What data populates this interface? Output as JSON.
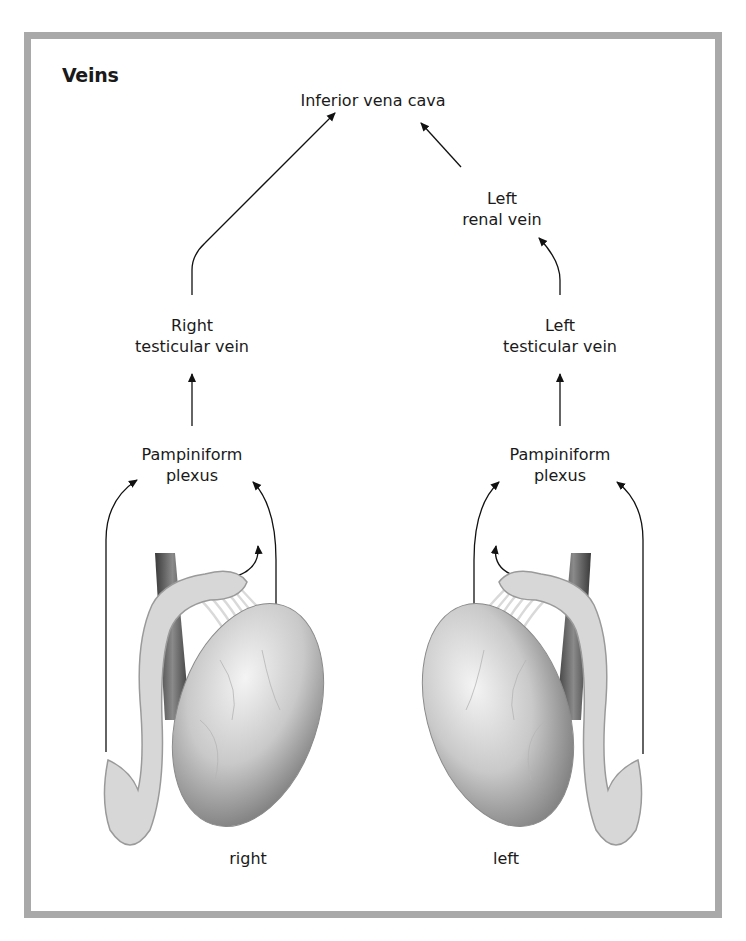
{
  "figure": {
    "title": "Veins",
    "frame_color": "#a9a9a9",
    "nodes": {
      "ivc": "Inferior vena cava",
      "left_renal": [
        "Left",
        "renal vein"
      ],
      "right_testicular": [
        "Right",
        "testicular vein"
      ],
      "left_testicular": [
        "Left",
        "testicular vein"
      ],
      "right_plexus": [
        "Pampiniform",
        "plexus"
      ],
      "left_plexus": [
        "Pampiniform",
        "plexus"
      ]
    },
    "illustrations": {
      "right_label": "right",
      "left_label": "left"
    },
    "flow": [
      "Pampiniform plexus (right) -> Right testicular vein -> Inferior vena cava",
      "Pampiniform plexus (left) -> Left testicular vein -> Left renal vein -> Inferior vena cava"
    ]
  }
}
